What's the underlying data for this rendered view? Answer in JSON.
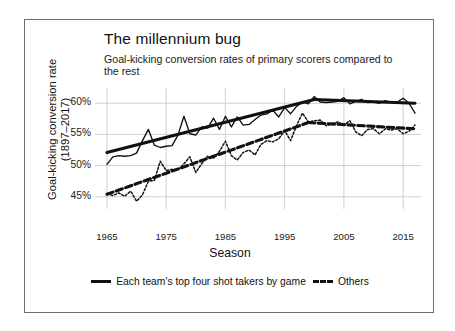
{
  "figure": {
    "title": "The millennium bug",
    "subtitle": "Goal-kicking conversion rates of primary scorers compared to the rest"
  },
  "chart_data": {
    "type": "line",
    "title": "The millennium bug",
    "subtitle": "Goal-kicking conversion rates of primary scorers compared to the rest",
    "xlabel": "Season",
    "ylabel": "Goal-kicking conversion rate (1897–2017)",
    "ylabel_line1": "Goal-kicking conversion rate",
    "ylabel_line2": "(1897–2017)",
    "xlim": [
      1964,
      2017
    ],
    "ylim": [
      44.0,
      61.8
    ],
    "xticks": [
      1965,
      1975,
      1985,
      1995,
      2005,
      2015
    ],
    "xtick_labels": [
      "1965",
      "1975",
      "1985",
      "1995",
      "2005",
      "2015"
    ],
    "yticks": [
      45,
      50,
      55,
      60
    ],
    "ytick_labels": [
      "45%",
      "50%",
      "55%",
      "60%"
    ],
    "grid": true,
    "legend_position": "bottom",
    "colors": {
      "line": "#111111",
      "grid": "#cfcfcf",
      "border": "#6e6e6e",
      "background": "#ffffff"
    },
    "series": [
      {
        "name": "Each team's top four shot takers by game",
        "style": "solid",
        "x": [
          1965,
          1966,
          1967,
          1968,
          1969,
          1970,
          1971,
          1972,
          1973,
          1974,
          1975,
          1976,
          1977,
          1978,
          1979,
          1980,
          1981,
          1982,
          1983,
          1984,
          1985,
          1986,
          1987,
          1988,
          1989,
          1990,
          1991,
          1992,
          1993,
          1994,
          1995,
          1996,
          1997,
          1998,
          1999,
          2000,
          2001,
          2002,
          2003,
          2004,
          2005,
          2006,
          2007,
          2008,
          2009,
          2010,
          2011,
          2012,
          2013,
          2014,
          2015,
          2016,
          2017
        ],
        "values": [
          50.2,
          51.4,
          51.6,
          51.5,
          51.6,
          52.0,
          54.0,
          55.8,
          53.3,
          52.9,
          53.1,
          53.2,
          54.9,
          57.9,
          55.1,
          54.9,
          56.2,
          56.0,
          57.6,
          55.8,
          57.9,
          56.2,
          57.8,
          56.5,
          56.6,
          57.4,
          58.1,
          58.3,
          58.9,
          57.8,
          59.3,
          58.3,
          59.5,
          60.2,
          59.9,
          61.1,
          60.2,
          60.1,
          60.2,
          60.3,
          60.9,
          59.9,
          60.3,
          60.6,
          60.1,
          60.2,
          60.0,
          60.4,
          60.1,
          60.2,
          60.8,
          60.0,
          58.4
        ]
      },
      {
        "name": "Others",
        "style": "dashed",
        "x": [
          1965,
          1966,
          1967,
          1968,
          1969,
          1970,
          1971,
          1972,
          1973,
          1974,
          1975,
          1976,
          1977,
          1978,
          1979,
          1980,
          1981,
          1982,
          1983,
          1984,
          1985,
          1986,
          1987,
          1988,
          1989,
          1990,
          1991,
          1992,
          1993,
          1994,
          1995,
          1996,
          1997,
          1998,
          1999,
          2000,
          2001,
          2002,
          2003,
          2004,
          2005,
          2006,
          2007,
          2008,
          2009,
          2010,
          2011,
          2012,
          2013,
          2014,
          2015,
          2016,
          2017
        ],
        "values": [
          45.5,
          45.2,
          45.6,
          45.1,
          45.9,
          44.3,
          45.3,
          47.5,
          47.6,
          50.7,
          49.2,
          49.4,
          49.3,
          50.3,
          51.4,
          48.9,
          50.3,
          51.5,
          51.2,
          52.3,
          53.9,
          51.6,
          50.9,
          52.1,
          52.5,
          51.7,
          53.4,
          54.0,
          53.8,
          54.3,
          55.6,
          54.0,
          56.4,
          58.4,
          57.0,
          57.2,
          57.3,
          56.4,
          56.7,
          57.0,
          56.5,
          57.2,
          55.4,
          54.8,
          55.8,
          55.9,
          55.1,
          55.9,
          55.7,
          55.9,
          55.1,
          55.5,
          56.5
        ]
      }
    ],
    "trendlines": [
      {
        "name": "Each team's top four shot takers by game trend",
        "style": "solid",
        "segments": [
          {
            "x0": 1965,
            "y0": 52.1,
            "x1": 2000,
            "y1": 60.6
          },
          {
            "x0": 2000,
            "y0": 60.6,
            "x1": 2017,
            "y1": 60.0
          }
        ]
      },
      {
        "name": "Others trend",
        "style": "dashed",
        "segments": [
          {
            "x0": 1965,
            "y0": 45.4,
            "x1": 1999,
            "y1": 56.9
          },
          {
            "x0": 1999,
            "y0": 56.9,
            "x1": 2017,
            "y1": 55.9
          }
        ]
      }
    ],
    "legend": [
      {
        "label": "Each team's top four shot takers by game",
        "style": "solid"
      },
      {
        "label": "Others",
        "style": "dashed"
      }
    ]
  }
}
